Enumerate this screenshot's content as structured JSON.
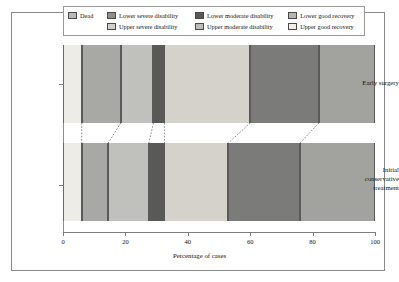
{
  "chart_data": {
    "type": "bar",
    "orientation": "horizontal",
    "stacked": true,
    "title": "",
    "xlabel": "Percentage of cases",
    "ylabel": "",
    "xlim": [
      0,
      100
    ],
    "xticks": [
      0,
      20,
      40,
      60,
      80,
      100
    ],
    "xtick_labels": [
      "0",
      "20",
      "40",
      "60",
      "80",
      "100"
    ],
    "grid": false,
    "legend_position": "top",
    "categories": [
      "Early surgery",
      "Initial conservative treatment"
    ],
    "series": [
      {
        "name": "Dead",
        "color": "#eeece6",
        "values": [
          6,
          6
        ]
      },
      {
        "name": "Lower severe disability",
        "color": "#a8a8a4",
        "values": [
          12.5,
          8.5
        ]
      },
      {
        "name": "Upper severe disability",
        "color": "#c0c0bc",
        "values": [
          10.5,
          13
        ]
      },
      {
        "name": "Lower moderate disability",
        "color": "#595957",
        "values": [
          3.5,
          5
        ]
      },
      {
        "name": "Upper moderate disability",
        "color": "#d4d2cb",
        "values": [
          27.5,
          20.5
        ]
      },
      {
        "name": "Lower good recovery",
        "color": "#7b7b79",
        "values": [
          22,
          23
        ]
      },
      {
        "name": "Upper good recovery",
        "color": "#a2a29e",
        "values": [
          18,
          24
        ]
      }
    ],
    "boundaries": {
      "Early surgery": [
        0,
        6,
        18.5,
        29,
        32.5,
        60,
        82,
        100
      ],
      "Initial conservative treatment": [
        0,
        6,
        14.5,
        27.5,
        32.5,
        53,
        76,
        100
      ]
    }
  },
  "legend": {
    "rows": [
      [
        {
          "label": "Dead",
          "color": "#b9b9b5"
        },
        {
          "label": "Lower severe disability",
          "color": "#8f8f8c"
        },
        {
          "label": "Lower moderate disability",
          "color": "#595957"
        },
        {
          "label": "Lower good recovery",
          "color": "#b5b5b1"
        }
      ],
      [
        {
          "label": "Upper severe disability",
          "color": "#d2d2cd"
        },
        {
          "label": "Upper moderate disability",
          "color": "#bcbcb8"
        },
        {
          "label": "Upper good recovery",
          "color": "#f0efea"
        }
      ]
    ]
  },
  "axes": {
    "x_title": "Percentage of cases",
    "x_tick_labels": [
      "0",
      "20",
      "40",
      "60",
      "80",
      "100"
    ],
    "y_labels": {
      "top": "Early surgery",
      "bottom_line1": "Initial",
      "bottom_line2": "conservative",
      "bottom_line3": "treatment"
    }
  }
}
